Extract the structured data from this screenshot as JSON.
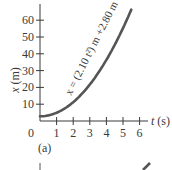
{
  "chart_data": {
    "type": "line",
    "title": "",
    "panel_label": "(a)",
    "xlabel": "t (s)",
    "xlabel_var": "t",
    "xlabel_unit": "(s)",
    "ylabel": "x (m)",
    "ylabel_var": "x",
    "ylabel_unit": "(m)",
    "xlim": [
      0,
      6.5
    ],
    "ylim": [
      0,
      67
    ],
    "xticks": [
      1,
      2,
      3,
      4,
      5,
      6
    ],
    "yticks": [
      10,
      20,
      30,
      40,
      50,
      60
    ],
    "origin_label": "0",
    "grid": false,
    "legend": null,
    "annotation": "x = (2.10 t²) m + 2.80 m",
    "series": [
      {
        "name": "x = (2.10 t²) m + 2.80 m",
        "equation": {
          "a": 2.1,
          "c": 2.8
        },
        "x": [
          0,
          0.5,
          1,
          1.5,
          2,
          2.5,
          3,
          3.5,
          4,
          4.5,
          5,
          5.5
        ],
        "values": [
          2.8,
          3.33,
          4.9,
          7.53,
          11.2,
          15.93,
          21.7,
          28.53,
          36.4,
          45.33,
          55.3,
          66.33
        ]
      }
    ]
  },
  "labels": {
    "panel": "(a)",
    "origin": "0",
    "xaxis_var": "t",
    "xaxis_unit": " (s)",
    "yaxis_var": "x",
    "yaxis_unit": " (m)",
    "curve_annotation": "x = (2.10 t²) m +2.80 m"
  },
  "colors": {
    "axis": "#3a3a3a",
    "curve": "#555555",
    "text": "#3a3a3a"
  }
}
